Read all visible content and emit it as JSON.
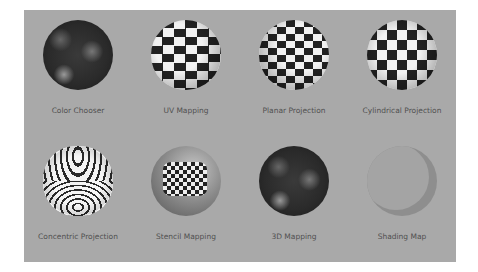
{
  "items": [
    {
      "label": "Color Chooser",
      "type": "solid-dark"
    },
    {
      "label": "UV Mapping",
      "type": "checker"
    },
    {
      "label": "Planar Projection",
      "type": "checker-planar"
    },
    {
      "label": "Cylindrical Projection",
      "type": "checker"
    },
    {
      "label": "Concentric Projection",
      "type": "concentric"
    },
    {
      "label": "Stencil Mapping",
      "type": "stencil"
    },
    {
      "label": "3D Mapping",
      "type": "solid-dark"
    },
    {
      "label": "Shading Map",
      "type": "shading"
    }
  ],
  "colors": {
    "background": "#a9a9a9",
    "label": "#505050"
  }
}
